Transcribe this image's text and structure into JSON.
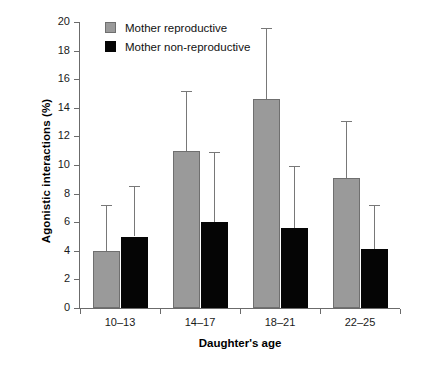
{
  "chart_data": {
    "type": "bar",
    "title": "",
    "xlabel": "Daughter's age",
    "ylabel": "Agonistic interactions (%)",
    "categories": [
      "10–13",
      "14–17",
      "18–21",
      "22–25"
    ],
    "ylim": [
      0,
      20
    ],
    "yticks": [
      0,
      2,
      4,
      6,
      8,
      10,
      12,
      14,
      16,
      18,
      20
    ],
    "ytick_labels": [
      "0",
      "2",
      "4",
      "6",
      "8",
      "10",
      "12",
      "14",
      "16",
      "18",
      "20"
    ],
    "grid": false,
    "legend_position": "top-left-inside",
    "series": [
      {
        "name": "Mother reproductive",
        "color": "#9a9a9a",
        "values": [
          4.0,
          11.0,
          14.6,
          9.1
        ],
        "error_upper": [
          7.2,
          15.2,
          19.6,
          13.1
        ]
      },
      {
        "name": "Mother non-reproductive",
        "color": "#000000",
        "values": [
          5.0,
          6.0,
          5.6,
          4.1
        ],
        "error_upper": [
          8.5,
          10.9,
          9.9,
          7.2
        ]
      }
    ]
  },
  "legend": {
    "items": [
      {
        "label": "Mother reproductive",
        "swatch": "rep"
      },
      {
        "label": "Mother non-reproductive",
        "swatch": "nonrep"
      }
    ]
  }
}
